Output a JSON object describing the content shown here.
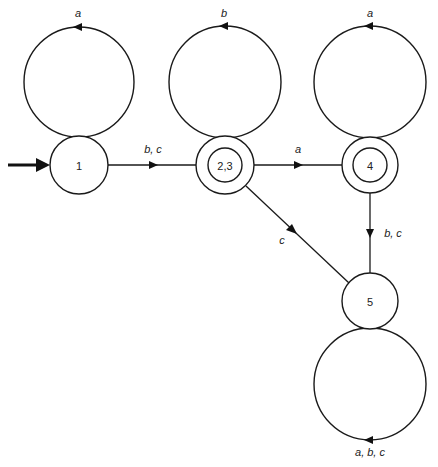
{
  "diagram": {
    "type": "finite-state-automaton",
    "start_state": "1",
    "states": [
      {
        "id": "s1",
        "label": "1",
        "accepting": false,
        "cx": 79,
        "cy": 165
      },
      {
        "id": "s23",
        "label": "2,3",
        "accepting": true,
        "cx": 225,
        "cy": 165
      },
      {
        "id": "s4",
        "label": "4",
        "accepting": true,
        "cx": 370,
        "cy": 165
      },
      {
        "id": "s5",
        "label": "5",
        "accepting": false,
        "cx": 370,
        "cy": 301
      }
    ],
    "transitions": [
      {
        "from": "1",
        "to": "1",
        "label": "a"
      },
      {
        "from": "2,3",
        "to": "2,3",
        "label": "b"
      },
      {
        "from": "4",
        "to": "4",
        "label": "a"
      },
      {
        "from": "1",
        "to": "2,3",
        "label": "b, c"
      },
      {
        "from": "2,3",
        "to": "4",
        "label": "a"
      },
      {
        "from": "2,3",
        "to": "5",
        "label": "c"
      },
      {
        "from": "4",
        "to": "5",
        "label": "b, c"
      },
      {
        "from": "5",
        "to": "5",
        "label": "a, b, c"
      }
    ],
    "colors": {
      "stroke": "#1a1a1a",
      "background": "#ffffff"
    }
  }
}
